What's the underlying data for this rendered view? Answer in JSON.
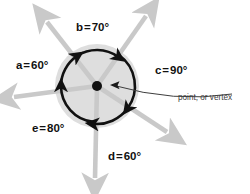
{
  "diagram": {
    "vertex": {
      "x": 97,
      "y": 86,
      "dot_radius": 5,
      "color": "#111111"
    },
    "shaded_circle": {
      "cx": 97,
      "cy": 86,
      "r": 42,
      "fill": "#dedede"
    },
    "ray_color": "#c9c9c9",
    "arc_color": "#111111",
    "angles": [
      {
        "id": "a",
        "label": "a",
        "value": "60",
        "unit": "°",
        "equals": "=",
        "text": "a = 60°",
        "label_x": 16,
        "label_y": 69,
        "arc_start_deg": 180,
        "arc_end_deg": 124,
        "arrow_at": "end"
      },
      {
        "id": "b",
        "label": "b",
        "value": "70",
        "unit": "°",
        "equals": "=",
        "text": "b = 70°",
        "label_x": 76,
        "label_y": 31,
        "arc_start_deg": 124,
        "arc_end_deg": 54,
        "arrow_at": "end"
      },
      {
        "id": "c",
        "label": "c",
        "value": "90",
        "unit": "°",
        "equals": "=",
        "text": "c = 90°",
        "label_x": 155,
        "label_y": 74,
        "arc_start_deg": 54,
        "arc_end_deg": -36,
        "arrow_at": "end"
      },
      {
        "id": "d",
        "label": "d",
        "value": "60",
        "unit": "°",
        "equals": "=",
        "text": "d = 60°",
        "label_x": 108,
        "label_y": 160,
        "arc_start_deg": -36,
        "arc_end_deg": -96,
        "arrow_at": "end"
      },
      {
        "id": "e",
        "label": "e",
        "value": "80",
        "unit": "°",
        "equals": "=",
        "text": "e = 80°",
        "label_x": 32,
        "label_y": 132,
        "arc_start_deg": -96,
        "arc_end_deg": -180,
        "arrow_at": "end"
      }
    ],
    "rays": [
      {
        "id": "ray-left",
        "angle_deg": 180,
        "tip_x": 4,
        "tip_y": 97
      },
      {
        "id": "ray-upper-left",
        "angle_deg": 124,
        "tip_x": 40,
        "tip_y": 13
      },
      {
        "id": "ray-upper-right",
        "angle_deg": 54,
        "tip_x": 152,
        "tip_y": 6
      },
      {
        "id": "ray-lower-right",
        "angle_deg": -36,
        "tip_x": 176,
        "tip_y": 141
      },
      {
        "id": "ray-down",
        "angle_deg": -96,
        "tip_x": 95,
        "tip_y": 189
      }
    ],
    "callout": {
      "text": "point, or vertex",
      "text_x": 178,
      "text_y": 100,
      "leader_from_x": 232,
      "leader_from_y": 94,
      "leader_to_x": 110,
      "leader_to_y": 85,
      "color": "#3d3d3d"
    }
  }
}
